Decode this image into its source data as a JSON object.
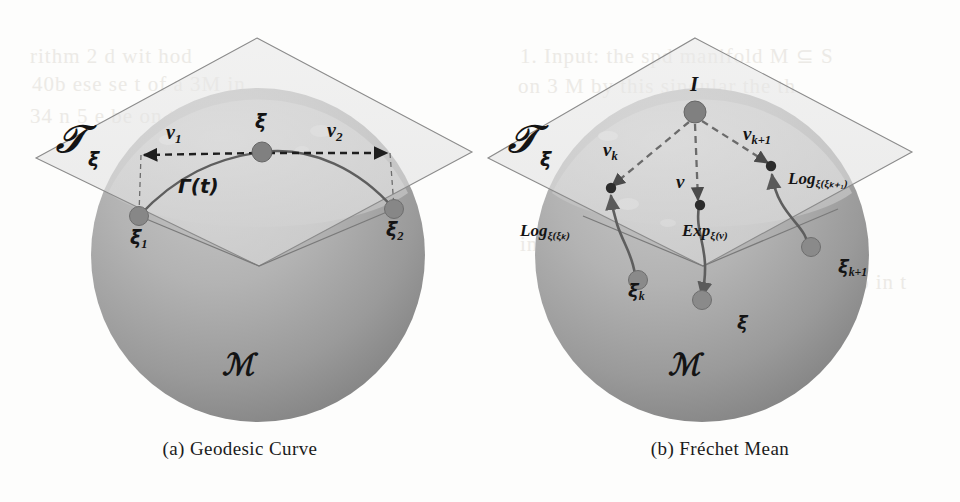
{
  "figure": {
    "background_color": "#fdfdfc",
    "sphere_fill_top": "#b9b9b9",
    "sphere_fill_bottom": "#8f8f8f",
    "cap_fill": "#c9c9c9",
    "plane_fill": "#e3e3e3",
    "marker_color": "#7d7d7d",
    "line_color": "#6a6a6a",
    "text_color": "#141414"
  },
  "panels": [
    {
      "id": "panel-a",
      "caption": "(a) Geodesic Curve",
      "manifold_label": "ℳ",
      "tangent_space": {
        "symbol": "𝒯",
        "subscript": "ξ"
      },
      "labels": [
        {
          "name": "vector-v1",
          "text": "v",
          "sub": "1",
          "x": 166,
          "y": 122
        },
        {
          "name": "vector-v2",
          "text": "v",
          "sub": "2",
          "x": 327,
          "y": 120
        },
        {
          "name": "point-xi",
          "text": "ξ",
          "sub": "",
          "x": 255,
          "y": 112
        },
        {
          "name": "point-xi1",
          "text": "ξ",
          "sub": "1",
          "x": 130,
          "y": 228
        },
        {
          "name": "point-xi2",
          "text": "ξ",
          "sub": "2",
          "x": 386,
          "y": 220
        },
        {
          "name": "geodesic-gamma",
          "text": "Γ(t)",
          "sub": "",
          "x": 178,
          "y": 176
        }
      ]
    },
    {
      "id": "panel-b",
      "caption": "(b) Fréchet Mean",
      "manifold_label": "ℳ",
      "tangent_space": {
        "symbol": "𝒯",
        "subscript": "ξ"
      },
      "labels": [
        {
          "name": "point-identity",
          "text": "I",
          "sub": "",
          "x": 210,
          "y": 74
        },
        {
          "name": "vector-vk",
          "text": "v",
          "sub": "k",
          "x": 123,
          "y": 140
        },
        {
          "name": "vector-v",
          "text": "v",
          "sub": "",
          "x": 196,
          "y": 172
        },
        {
          "name": "vector-vk1",
          "text": "v",
          "sub": "k+1",
          "x": 263,
          "y": 124
        },
        {
          "name": "log-map-xik",
          "text": "Log",
          "sub": "ξ(ξₖ)",
          "x": 40,
          "y": 222
        },
        {
          "name": "exp-map-v",
          "text": "Exp",
          "sub": "ξ(v)",
          "x": 202,
          "y": 222
        },
        {
          "name": "log-map-xik1",
          "text": "Log",
          "sub": "ξ(ξₖ₊₁)",
          "x": 308,
          "y": 170
        },
        {
          "name": "point-xik",
          "text": "ξ",
          "sub": "k",
          "x": 148,
          "y": 282
        },
        {
          "name": "point-xik1",
          "text": "ξ",
          "sub": "k+1",
          "x": 358,
          "y": 258
        },
        {
          "name": "point-xi-mean",
          "text": "ξ",
          "sub": "",
          "x": 257,
          "y": 314
        }
      ]
    }
  ],
  "bleed_text": [
    {
      "text": "rithm  2  d  wit  hod",
      "x": 30,
      "y": 44
    },
    {
      "text": "1.  Input:  the  spd  manifold  M  ⊆  S",
      "x": 520,
      "y": 44
    },
    {
      "text": "on  3  M  by  this  singular  the  th",
      "x": 518,
      "y": 74
    },
    {
      "text": "40b  ese  se  t  of  a  3M  in",
      "x": 32,
      "y": 72
    },
    {
      "text": "34  n  5  e  be  on  the  hi  n",
      "x": 30,
      "y": 104
    },
    {
      "text": "in  1  to  M  a  of  a",
      "x": 520,
      "y": 232
    },
    {
      "text": "kbr  nwel  dv",
      "x": 300,
      "y": 268
    },
    {
      "text": "fo  in  t",
      "x": 850,
      "y": 270
    }
  ]
}
